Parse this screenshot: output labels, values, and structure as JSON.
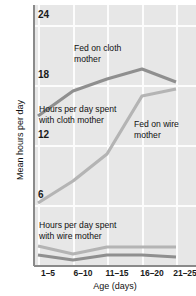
{
  "chart_data": {
    "type": "line",
    "title": "",
    "xlabel": "Age (days)",
    "ylabel": "Mean hours per day",
    "categories": [
      "1–5",
      "6–10",
      "11–15",
      "16–20",
      "21–25"
    ],
    "ylim": [
      0,
      26
    ],
    "yticks": [
      6,
      12,
      18,
      24
    ],
    "ytick_labels": [
      "6",
      "12",
      "18",
      "24"
    ],
    "grid": true,
    "legend": "none",
    "series": [
      {
        "name": "Hours per day spent with cloth mother – fed on cloth mother",
        "color": "#8f8f8f",
        "values": [
          14.9,
          17.4,
          18.6,
          19.6,
          18.3
        ]
      },
      {
        "name": "Hours per day spent with cloth mother – fed on wire mother",
        "color": "#b4b4b4",
        "values": [
          6.2,
          8.4,
          11.1,
          16.9,
          17.6
        ]
      },
      {
        "name": "Hours per day spent with wire mother – fed on wire mother",
        "color": "#b4b4b4",
        "values": [
          1.9,
          1.1,
          1.8,
          1.8,
          1.8
        ]
      },
      {
        "name": "Hours per day spent with wire mother – fed on cloth mother",
        "color": "#8f8f8f",
        "values": [
          1.0,
          0.5,
          1.0,
          1.0,
          0.8
        ]
      }
    ],
    "annotations": [
      {
        "id": "fed-on-cloth-mother",
        "text": "Fed on cloth\nmother"
      },
      {
        "id": "hours-with-cloth-mother",
        "text": "Hours per day spent\nwith cloth mother"
      },
      {
        "id": "fed-on-wire-mother",
        "text": "Fed on wire\nmother"
      },
      {
        "id": "hours-with-wire-mother",
        "text": "Hours per day spent\nwith wire mother"
      }
    ],
    "colors": {
      "plot_background": "#e7e7e7",
      "gridline": "#fcfcfc",
      "axis": "#8a8a8a",
      "dark_series": "#8f8f8f",
      "light_series": "#b4b4b4",
      "text": "#111111"
    }
  }
}
